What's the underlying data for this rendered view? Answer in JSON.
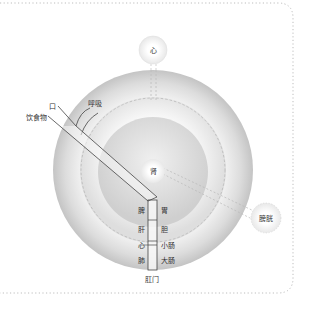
{
  "diagram": {
    "title": "",
    "nodes": {
      "heart_top": {
        "label": "心"
      },
      "kidney": {
        "label": "肾"
      },
      "bladder": {
        "label": "膀胱"
      }
    },
    "inputs": {
      "breath": {
        "label": "呼吸"
      },
      "mouth": {
        "label": "口"
      },
      "food": {
        "label": "饮食物"
      }
    },
    "tract": {
      "left_labels": [
        "脾",
        "肝",
        "心",
        "肺"
      ],
      "right_labels": [
        "胃",
        "胆",
        "小肠",
        "大肠"
      ],
      "exit_label": "肛门"
    },
    "colors": {
      "border": "#bdbdbd",
      "ring_outer": "#cfcfcf",
      "ring_mid": "#e6e6e6",
      "ring_inner": "#d6d6d6",
      "node_fill": "#f2f2f2",
      "line": "#444444"
    }
  }
}
